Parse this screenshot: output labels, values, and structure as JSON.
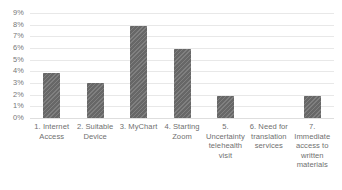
{
  "chart_data": {
    "type": "bar",
    "title": "",
    "subtitle": "",
    "xlabel": "",
    "ylabel": "",
    "grid": true,
    "legend": false,
    "legend_position": "none",
    "ylim": [
      0,
      9
    ],
    "y_unit": "percent",
    "y_ticks": [
      {
        "value": 9,
        "label": "9%"
      },
      {
        "value": 8,
        "label": "8%"
      },
      {
        "value": 7,
        "label": "7%"
      },
      {
        "value": 6,
        "label": "6%"
      },
      {
        "value": 5,
        "label": "5%"
      },
      {
        "value": 4,
        "label": "4%"
      },
      {
        "value": 3,
        "label": "3%"
      },
      {
        "value": 2,
        "label": "2%"
      },
      {
        "value": 1,
        "label": "1%"
      },
      {
        "value": 0,
        "label": "0%"
      }
    ],
    "categories": [
      "1. Internet Access",
      "2. Suitable Device",
      "3. MyChart",
      "4. Starting Zoom",
      "5. Uncertainty telehealth visit",
      "6. Need for translation services",
      "7. Immediate access to written materials"
    ],
    "values": [
      3.9,
      3.0,
      7.9,
      5.9,
      1.9,
      0,
      1.9
    ],
    "bar_color": "#6d6d6d",
    "gridline_color": "#e8e8e8",
    "background_color": "#ffffff"
  }
}
